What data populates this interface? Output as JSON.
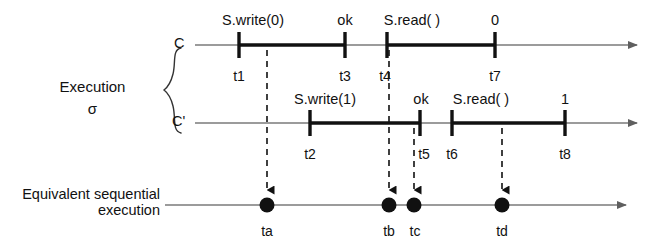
{
  "figure": {
    "type": "timeline-diagram",
    "title_labels": {
      "execution": "Execution",
      "execution_symbol": "σ",
      "equivalent_line1": "Equivalent sequential",
      "equivalent_line2": "execution"
    },
    "colors": {
      "line": "#7a7a7a",
      "thick": "#111111",
      "text": "#111111",
      "dashed": "#111111",
      "dot": "#111111"
    },
    "timelines": [
      {
        "id": "C",
        "name": "C",
        "y": 45,
        "line_start_x": 195,
        "line_end_x": 643,
        "ticks": [
          {
            "id": "t1",
            "x": 239,
            "time_label": "t1",
            "op_label": "S.write(0)"
          },
          {
            "id": "t3",
            "x": 345,
            "time_label": "t3",
            "op_label": "ok"
          },
          {
            "id": "t4",
            "x": 387,
            "time_label": "t4",
            "op_label": "S.read( )"
          },
          {
            "id": "t7",
            "x": 495,
            "time_label": "t7",
            "op_label": "0"
          }
        ],
        "intervals": [
          {
            "from_x": 239,
            "to_x": 345
          },
          {
            "from_x": 387,
            "to_x": 495
          }
        ]
      },
      {
        "id": "Cprime",
        "name": "C'",
        "y": 123,
        "line_start_x": 195,
        "line_end_x": 643,
        "ticks": [
          {
            "id": "t2",
            "x": 310,
            "time_label": "t2",
            "op_label": "S.write(1)"
          },
          {
            "id": "t5",
            "x": 420,
            "time_label": "t5",
            "op_label": "ok"
          },
          {
            "id": "t6",
            "x": 452,
            "time_label": "t6",
            "op_label": "S.read( )"
          },
          {
            "id": "t8",
            "x": 565,
            "time_label": "t8",
            "op_label": "1"
          }
        ],
        "intervals": [
          {
            "from_x": 310,
            "to_x": 420
          },
          {
            "from_x": 452,
            "to_x": 565
          }
        ]
      }
    ],
    "sequential_timeline": {
      "id": "equivalent-sequential",
      "y": 205,
      "line_start_x": 165,
      "line_end_x": 632,
      "points": [
        {
          "id": "ta",
          "x": 267,
          "label": "ta"
        },
        {
          "id": "tb",
          "x": 389,
          "label": "tb"
        },
        {
          "id": "tc",
          "x": 414,
          "label": "tc"
        },
        {
          "id": "td",
          "x": 502,
          "label": "td"
        }
      ]
    },
    "mappings": [
      {
        "id": "t1-to-ta",
        "from_tick": "t1",
        "from_x": 267,
        "from_y": 52,
        "to_x": 267,
        "to_y": 198
      },
      {
        "id": "t4-to-tb",
        "from_tick": "t4",
        "from_x": 389,
        "from_y": 52,
        "to_x": 389,
        "to_y": 198
      },
      {
        "id": "t5-to-tc",
        "from_tick": "t5",
        "from_x": 414,
        "from_y": 130,
        "to_x": 414,
        "to_y": 198
      },
      {
        "id": "t7-to-td",
        "from_tick": "t7",
        "from_x": 502,
        "from_y": 130,
        "to_x": 502,
        "to_y": 198
      }
    ],
    "brace": {
      "x": 170,
      "top_y": 48,
      "bottom_y": 133
    }
  }
}
